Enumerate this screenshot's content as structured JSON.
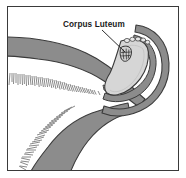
{
  "figure": {
    "domain": "anatomical-illustration",
    "border_color": "#3a3a3a",
    "background_color": "#ffffff"
  },
  "labels": [
    {
      "id": "corpus-luteum",
      "text": "Corpus Luteum",
      "x": 55,
      "y": 20,
      "leader_from": [
        94,
        23
      ],
      "leader_to": [
        117,
        45
      ]
    }
  ],
  "palette": {
    "tissue_gray": "#8c8c8c",
    "tissue_gray_dark": "#7a7a7a",
    "outline": "#3b3b3b",
    "ovary_fill": "#d6d6d6",
    "ovary_light": "#e2e2e2",
    "corpus_luteum_fill": "#cfcfcf",
    "fimbriae": "#9a9a9a",
    "white": "#ffffff"
  },
  "structures": [
    {
      "id": "uterine-horn-upper",
      "name": "Uterine horn (upper)",
      "fill": "#8c8c8c"
    },
    {
      "id": "uterine-horn-lower",
      "name": "Uterine horn (lower)",
      "fill": "#8c8c8c"
    },
    {
      "id": "fimbriae-upper",
      "name": "Fimbriae (upper fringe)",
      "fill": "#9a9a9a"
    },
    {
      "id": "fimbriae-lower",
      "name": "Fimbriae (lower fringe)",
      "fill": "#9a9a9a"
    },
    {
      "id": "ovary",
      "name": "Ovary",
      "fill": "#d6d6d6"
    },
    {
      "id": "corpus-luteum",
      "name": "Corpus Luteum",
      "fill": "#cfcfcf"
    },
    {
      "id": "oviduct-loop-outer",
      "name": "Oviduct (outer loop)",
      "fill": "#8c8c8c"
    },
    {
      "id": "oviduct-loop-inner",
      "name": "Oviduct (inner loop)",
      "fill": "#8c8c8c"
    },
    {
      "id": "infundibulum",
      "name": "Infundibulum",
      "fill": "#d6d6d6"
    }
  ]
}
